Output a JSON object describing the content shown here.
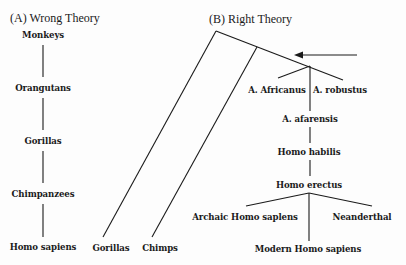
{
  "panel_a": {
    "title": "(A) Wrong Theory",
    "nodes": [
      "Monkeys",
      "Orangutans",
      "Gorillas",
      "Chimpanzees",
      "Homo sapiens"
    ]
  },
  "panel_b": {
    "title": "(B) Right Theory",
    "leaves": {
      "gorillas": "Gorillas",
      "chimps": "Chimps"
    },
    "hominins": {
      "a_africanus": "A. Africanus",
      "a_robustus": "A. robustus",
      "a_afarensis": "A. afarensis",
      "homo_habilis": "Homo habilis",
      "homo_erectus": "Homo erectus",
      "archaic_homo_sapiens": "Archaic Homo saplens",
      "neanderthal": "Neanderthal",
      "modern_homo_sapiens": "Modern Homo sapiens"
    },
    "arrow": "left-arrow"
  },
  "colors": {
    "line": "#1a1a1a",
    "background": "#fdfdfd"
  }
}
